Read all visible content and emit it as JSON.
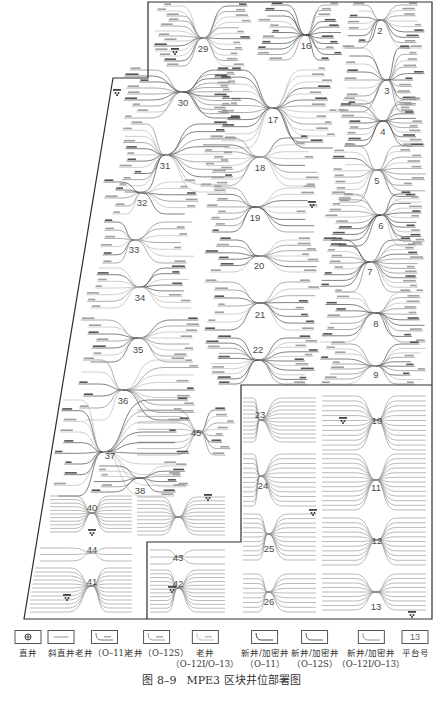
{
  "map": {
    "platforms": [
      {
        "label": "29"
      },
      {
        "label": "16"
      },
      {
        "label": "2"
      },
      {
        "label": "30"
      },
      {
        "label": "17"
      },
      {
        "label": "3"
      },
      {
        "label": "4"
      },
      {
        "label": "31"
      },
      {
        "label": "18"
      },
      {
        "label": "5"
      },
      {
        "label": "32"
      },
      {
        "label": "19"
      },
      {
        "label": "6"
      },
      {
        "label": "33"
      },
      {
        "label": "20"
      },
      {
        "label": "7"
      },
      {
        "label": "34"
      },
      {
        "label": "21"
      },
      {
        "label": "8"
      },
      {
        "label": "35"
      },
      {
        "label": "22"
      },
      {
        "label": "9"
      },
      {
        "label": "36"
      },
      {
        "label": "23"
      },
      {
        "label": "45"
      },
      {
        "label": "10"
      },
      {
        "label": "37"
      },
      {
        "label": "38"
      },
      {
        "label": "24"
      },
      {
        "label": "11"
      },
      {
        "label": "40"
      },
      {
        "label": "25"
      },
      {
        "label": "12"
      },
      {
        "label": "44"
      },
      {
        "label": "43"
      },
      {
        "label": "41"
      },
      {
        "label": "42"
      },
      {
        "label": "26"
      },
      {
        "label": "13"
      }
    ]
  },
  "legend": {
    "items": [
      {
        "label_line1": "直井",
        "label_line2": "",
        "icon": "vertical-well-icon"
      },
      {
        "label_line1": "斜直井",
        "label_line2": "",
        "icon": "deviated-well-icon"
      },
      {
        "label_line1": "老井（O–11）",
        "label_line2": "",
        "icon": "old-well-o11-icon"
      },
      {
        "label_line1": "老井（O–12S）",
        "label_line2": "",
        "icon": "old-well-o12s-icon"
      },
      {
        "label_line1": "老井",
        "label_line2": "（O–12I/O–13）",
        "icon": "old-well-o12i-o13-icon"
      },
      {
        "label_line1": "新井/加密井",
        "label_line2": "（O–11）",
        "icon": "new-well-o11-icon"
      },
      {
        "label_line1": "新井/加密井",
        "label_line2": "（O–12S）",
        "icon": "new-well-o12s-icon"
      },
      {
        "label_line1": "新井/加密井",
        "label_line2": "（O–12I/O–13）",
        "icon": "new-well-o12i-o13-icon"
      },
      {
        "label_line1": "平台号",
        "label_line2": "",
        "icon": "platform-number-icon",
        "icon_text": "13"
      }
    ]
  },
  "figure": {
    "caption_number": "图 8–9",
    "caption_title": "MPE3 区块井位部署图"
  }
}
